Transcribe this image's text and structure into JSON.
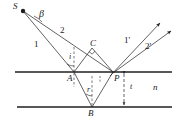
{
  "figure": {
    "stroke_color": "#1f1f1f",
    "text_color": "#1a1a1a",
    "background": "#ffffff",
    "width": 183,
    "height": 123
  },
  "points": [
    {
      "name": "source",
      "label": "S",
      "x": 22,
      "y": 10,
      "label_x": 13,
      "label_y": 3,
      "dot": true
    },
    {
      "name": "point-a",
      "label": "A",
      "x": 74,
      "y": 72,
      "label_x": 68,
      "label_y": 75,
      "dot": false
    },
    {
      "name": "point-b",
      "label": "B",
      "x": 92,
      "y": 107,
      "label_x": 89,
      "label_y": 110,
      "dot": false
    },
    {
      "name": "point-c",
      "label": "C",
      "x": 92,
      "y": 48,
      "label_x": 90,
      "label_y": 40,
      "dot": false
    },
    {
      "name": "point-p",
      "label": "P",
      "x": 113,
      "y": 72,
      "label_x": 115,
      "label_y": 75,
      "dot": false
    }
  ],
  "rays": {
    "incident_1": "1",
    "incident_2": "2",
    "reflected_1": "1'",
    "reflected_2": "2'"
  },
  "angles": {
    "beta": "β",
    "incidence": "i",
    "refraction": "r"
  },
  "medium": {
    "index_label": "n",
    "thickness_label": "t"
  },
  "label_positions": {
    "ray1": {
      "x": 36,
      "y": 44
    },
    "ray2": {
      "x": 61,
      "y": 30
    },
    "ray1p": {
      "x": 126,
      "y": 40
    },
    "ray2p": {
      "x": 147,
      "y": 45
    },
    "beta": {
      "x": 40,
      "y": 9
    },
    "i": {
      "x": 70,
      "y": 54
    },
    "r": {
      "x": 88,
      "y": 88
    },
    "n": {
      "x": 155,
      "y": 86
    },
    "t": {
      "x": 133,
      "y": 85
    }
  }
}
